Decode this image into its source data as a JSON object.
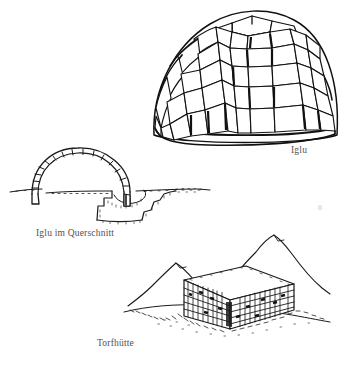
{
  "page": {
    "background_color": "#ffffff",
    "ink_color": "#1a1a1a",
    "caption_color": "#55504c",
    "width": 342,
    "height": 366,
    "type": "scanned-book-illustration-plate",
    "language": "de"
  },
  "figures": [
    {
      "id": "iglu",
      "caption": "Iglu",
      "description": "Line drawing of a domed igloo built of spiralling rows of cut snow blocks",
      "icon": "igloo-dome-icon",
      "block_rows": 6,
      "blocks_per_row": [
        4,
        7,
        8,
        9,
        9,
        8
      ]
    },
    {
      "id": "iglu-querschnitt",
      "caption": "Iglu im Querschnitt",
      "description": "Cross-section of an igloo showing the block arch above the snow line and the excavated entrance pit and cold trap below",
      "icon": "igloo-cross-section-icon",
      "arch_blocks": 15
    },
    {
      "id": "torfhuette",
      "caption": "Torfhütte",
      "description": "Hatched drawing of a turf and drystone hut with mountains in the background",
      "icon": "turf-hut-icon"
    }
  ],
  "artifacts": {
    "top_cropped_text": "",
    "right_margin_speck": ""
  }
}
